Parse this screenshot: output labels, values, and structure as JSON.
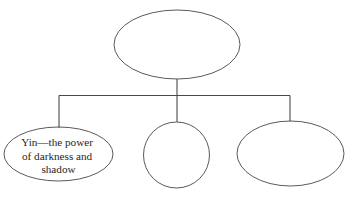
{
  "diagram": {
    "background_color": "#ffffff",
    "stroke_color": "#5a5a5a",
    "connector_color": "#4a4a4a",
    "text_color": "#262626",
    "nodes": [
      {
        "id": "root",
        "shape": "ellipse",
        "label": "",
        "cx": 177,
        "cy": 44.5,
        "rx": 63,
        "ry": 34.5
      },
      {
        "id": "child-left",
        "shape": "ellipse",
        "label": "Yin—the power of darkness and shadow",
        "lines": [
          "Yin—the power",
          "of darkness and",
          "shadow"
        ],
        "cx": 58.5,
        "cy": 154,
        "rx": 54.5,
        "ry": 27
      },
      {
        "id": "child-middle",
        "shape": "circle",
        "label": "",
        "cx": 176.5,
        "cy": 155,
        "rx": 33,
        "ry": 33
      },
      {
        "id": "child-right",
        "shape": "ellipse",
        "label": "",
        "cx": 290.5,
        "cy": 153.5,
        "rx": 53.5,
        "ry": 32.5
      }
    ],
    "connectors": [
      {
        "id": "root-stem",
        "from": "root",
        "to": "bus",
        "path": "M 177 79 L 177 95.5"
      },
      {
        "id": "bus-bar",
        "from": "bus",
        "to": "bus",
        "path": "M 59 95.5 L 290 95.5"
      },
      {
        "id": "drop-left",
        "from": "bus",
        "to": "child-left",
        "path": "M 59 95.5 L 59 128"
      },
      {
        "id": "drop-middle",
        "from": "bus",
        "to": "child-middle",
        "path": "M 177 95.5 L 177 122"
      },
      {
        "id": "drop-right",
        "from": "bus",
        "to": "child-right",
        "path": "M 290 95.5 L 290 121.5"
      }
    ]
  }
}
